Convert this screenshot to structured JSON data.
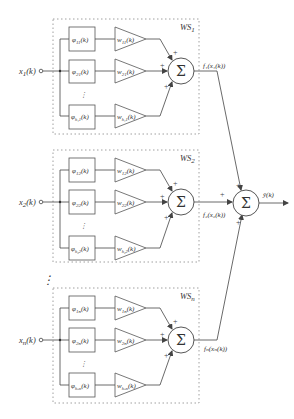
{
  "diagram": {
    "blocks": [
      {
        "id": "ws1",
        "title": "WS₁",
        "input": "x₁(k)",
        "output": "f₁(x₁(k))",
        "rows": [
          {
            "phi": "φ₁₁(k)",
            "w": "w₁₁(k)"
          },
          {
            "phi": "φ₂₁(k)",
            "w": "w₂₁(k)"
          },
          {
            "phi": "φ_{h₁1}(k)",
            "w": "w_{h₁1}(k)"
          }
        ],
        "signs": [
          "+",
          "+",
          "+"
        ]
      },
      {
        "id": "ws2",
        "title": "WS₂",
        "input": "x₂(k)",
        "output": "f₂(x₂(k))",
        "rows": [
          {
            "phi": "φ₁₂(k)",
            "w": "w₁₂(k)"
          },
          {
            "phi": "φ₂₂(k)",
            "w": "w₂₂(k)"
          },
          {
            "phi": "φ_{h₂2}(k)",
            "w": "w_{h₂2}(k)"
          }
        ],
        "signs": [
          "+",
          "+",
          "+"
        ]
      },
      {
        "id": "wsn",
        "title": "WSₙ",
        "input": "xₙ(k)",
        "output": "fₙ(xₙ(k))",
        "rows": [
          {
            "phi": "φ₁ₙ(k)",
            "w": "w₁ₙ(k)"
          },
          {
            "phi": "φ₂ₙ(k)",
            "w": "w₂ₙ(k)"
          },
          {
            "phi": "φ_{hₙn}(k)",
            "w": "w_{hₙn}(k)"
          }
        ],
        "signs": [
          "+",
          "+",
          "+"
        ]
      }
    ],
    "summer_symbol": "Σ",
    "final_output": "ŷ(k)",
    "final_signs": [
      "+",
      "+",
      "+"
    ],
    "vertical_ellipsis": "⋮",
    "colors": {
      "line": "#444444",
      "dotted": "#888888",
      "text": "#333333"
    }
  },
  "labels": {
    "ws1_title": "WS",
    "ws1_sub": "1",
    "ws2_title": "WS",
    "ws2_sub": "2",
    "wsn_title": "WS",
    "wsn_sub": "n",
    "x1": "x",
    "x1_sub": "1",
    "x_k": "(k)",
    "x2": "x",
    "x2_sub": "2",
    "xn": "x",
    "xn_sub": "n",
    "phi": "φ",
    "w": "w",
    "k": "(k)",
    "s11": "11",
    "s21": "21",
    "sh1": "h₁1",
    "s12": "12",
    "s22": "22",
    "sh2": "h₂2",
    "s1n": "1n",
    "s2n": "2n",
    "shn": "hₙn",
    "f1": "f₁(x₁(k))",
    "f2": "f₂(x₂(k))",
    "fn": "fₙ(xₙ(k))",
    "yhat": "ŷ(k)",
    "sigma": "Σ",
    "plus": "+",
    "vdots": "⋮"
  }
}
